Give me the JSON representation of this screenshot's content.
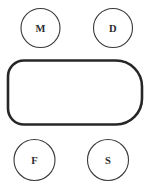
{
  "figure": {
    "background_color": "#ffffff",
    "width": 151,
    "height": 188
  },
  "style": {
    "node_stroke_color": "#3a3a3c",
    "node_fill_color": "#ffffff",
    "node_stroke_width": 1.1,
    "label_color": "#2b2b2d",
    "center_stroke_color": "#27272a",
    "center_fill_color": "#ffffff",
    "center_stroke_width": 2.6
  },
  "nodes": [
    {
      "id": "node-m",
      "label": "M",
      "position": "top-left",
      "cx": 40.5,
      "cy": 28,
      "r": 19.5
    },
    {
      "id": "node-d",
      "label": "D",
      "position": "top-right",
      "cx": 113,
      "cy": 28,
      "r": 19.5
    },
    {
      "id": "node-f",
      "label": "F",
      "position": "bottom-left",
      "cx": 34.5,
      "cy": 160,
      "r": 20.5
    },
    {
      "id": "node-s",
      "label": "S",
      "position": "bottom-right",
      "cx": 108,
      "cy": 160,
      "r": 20.5
    }
  ],
  "center_shape": {
    "id": "center-rounded-rectangle",
    "shape": "rounded-rectangle",
    "label": "",
    "x": 8,
    "y": 60.5,
    "width": 134,
    "height": 64,
    "corner_radius_left": 16,
    "corner_radius_right": 26
  }
}
